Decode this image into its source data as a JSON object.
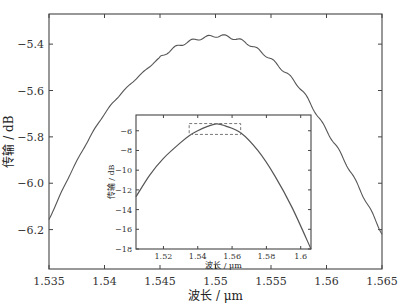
{
  "chart_data": [
    {
      "name": "main",
      "type": "line",
      "title": "",
      "xlabel": "波长 / μm",
      "ylabel": "传输 / dB",
      "xlim": [
        1.535,
        1.565
      ],
      "ylim": [
        -6.37,
        -5.27
      ],
      "xticks": [
        1.535,
        1.54,
        1.545,
        1.55,
        1.555,
        1.56,
        1.565
      ],
      "xtick_labels": [
        "1.535",
        "1.54",
        "1.545",
        "1.55",
        "1.555",
        "1.56",
        "1.565"
      ],
      "yticks": [
        -5.4,
        -5.6,
        -5.8,
        -6.0,
        -6.2
      ],
      "ytick_labels": [
        "-5.4",
        "-5.6",
        "-5.8",
        "-6.0",
        "-6.2"
      ],
      "grid": false,
      "legend": null,
      "line_color": "#555555",
      "series": [
        {
          "name": "transmission",
          "x": [
            1.535,
            1.5374,
            1.5403,
            1.5437,
            1.5466,
            1.5499,
            1.5522,
            1.554,
            1.5558,
            1.5577,
            1.5595,
            1.5613,
            1.5631,
            1.565
          ],
          "y": [
            -6.156,
            -5.914,
            -5.681,
            -5.512,
            -5.409,
            -5.365,
            -5.383,
            -5.43,
            -5.499,
            -5.594,
            -5.733,
            -5.875,
            -6.035,
            -6.216
          ]
        }
      ],
      "annotations": [
        "small periodic ripple visible on right half of curve"
      ]
    },
    {
      "name": "inset",
      "type": "line",
      "title": "",
      "xlabel": "波长 / μm",
      "ylabel": "传输 / dB",
      "xlim": [
        1.504,
        1.606
      ],
      "ylim": [
        -18,
        -4.4
      ],
      "xticks": [
        1.52,
        1.54,
        1.56,
        1.58,
        1.6
      ],
      "xtick_labels": [
        "1.52",
        "1.54",
        "1.56",
        "1.58",
        "1.6"
      ],
      "yticks": [
        -6,
        -8,
        -10,
        -12,
        -14,
        -16,
        -18
      ],
      "ytick_labels": [
        "-6",
        "-8",
        "-10",
        "-12",
        "-14",
        "-16",
        "-18"
      ],
      "grid": false,
      "legend": null,
      "series": [
        {
          "name": "transmission",
          "x": [
            1.504,
            1.512,
            1.52,
            1.53,
            1.535,
            1.54,
            1.545,
            1.551,
            1.556,
            1.565,
            1.575,
            1.585,
            1.595,
            1.606
          ],
          "y": [
            -12.7,
            -10.5,
            -8.8,
            -7.2,
            -6.5,
            -6.0,
            -5.6,
            -5.3,
            -5.5,
            -6.2,
            -8.0,
            -10.6,
            -13.8,
            -18.0
          ]
        }
      ],
      "highlight_box": {
        "x": [
          1.535,
          1.565
        ],
        "y": [
          -6.37,
          -5.27
        ],
        "style": "dashed"
      }
    }
  ]
}
